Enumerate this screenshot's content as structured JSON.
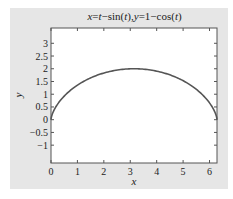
{
  "chart_data": {
    "type": "line",
    "title": "x=t−sin(t),y=1−cos(t)",
    "title_parts": [
      {
        "text": "x",
        "italic": true
      },
      {
        "text": "=",
        "italic": false
      },
      {
        "text": "t",
        "italic": true
      },
      {
        "text": "−sin(",
        "italic": false
      },
      {
        "text": "t",
        "italic": true
      },
      {
        "text": "),",
        "italic": false
      },
      {
        "text": "y",
        "italic": true
      },
      {
        "text": "=1−cos(",
        "italic": false
      },
      {
        "text": "t",
        "italic": true
      },
      {
        "text": ")",
        "italic": false
      }
    ],
    "xlabel": "x",
    "ylabel": "y",
    "xlim": [
      0,
      6.2832
    ],
    "ylim": [
      -1.7,
      3.6
    ],
    "xticks": [
      0,
      1,
      2,
      3,
      4,
      5,
      6
    ],
    "xtick_labels": [
      "0",
      "1",
      "2",
      "3",
      "4",
      "5",
      "6"
    ],
    "yticks": [
      -1,
      -0.5,
      0,
      0.5,
      1,
      1.5,
      2,
      2.5,
      3
    ],
    "ytick_labels": [
      "−1",
      "−0.5",
      "0",
      "0.5",
      "1",
      "1.5",
      "2",
      "2.5",
      "3"
    ],
    "grid": false,
    "legend": null,
    "series": [
      {
        "name": "cycloid",
        "parametric": "x=t-sin(t), y=1-cos(t), t in [0, 2π]",
        "color": "#555555",
        "x": [
          0,
          0.0235,
          0.1824,
          0.5796,
          1.2217,
          2.0708,
          3.1416,
          4.2124,
          5.0615,
          5.7036,
          6.1008,
          6.2597,
          6.2832
        ],
        "y": [
          0,
          0.2929,
          0.5,
          1.0,
          1.5,
          1.866,
          2.0,
          1.866,
          1.5,
          1.0,
          0.5,
          0.2929,
          0
        ]
      }
    ]
  },
  "colors": {
    "figure_bg": "#e6e6e6",
    "axes_bg": "#ffffff",
    "axes_edge": "#555555",
    "line": "#555555",
    "text": "#222222"
  }
}
